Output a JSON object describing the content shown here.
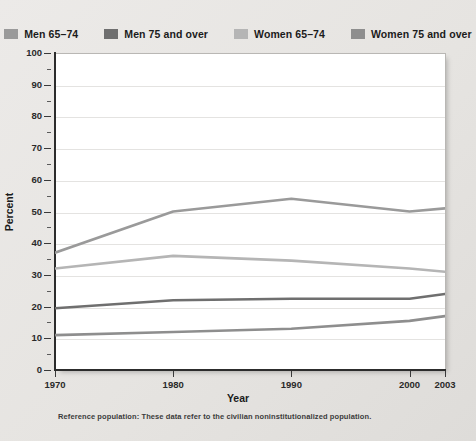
{
  "legend": {
    "items": [
      {
        "label": "Men 65–74",
        "color": "#9a9a9a",
        "key": "men_65_74"
      },
      {
        "label": "Men 75 and over",
        "color": "#6f6f6f",
        "key": "men_75_over"
      },
      {
        "label": "Women 65–74",
        "color": "#b5b5b5",
        "key": "women_65_74"
      },
      {
        "label": "Women 75 and over",
        "color": "#8e8e8e",
        "key": "women_75_over"
      }
    ]
  },
  "axes": {
    "y_title": "Percent",
    "x_title": "Year",
    "y_ticks": [
      "0",
      "10",
      "20",
      "30",
      "40",
      "50",
      "60",
      "70",
      "80",
      "90",
      "100"
    ],
    "x_ticks": [
      "1970",
      "1980",
      "1990",
      "2000",
      "2003"
    ]
  },
  "footnote": "Reference population: These data refer to the civilian noninstitutionalized population.",
  "chart_data": {
    "type": "line",
    "title": "",
    "xlabel": "Year",
    "ylabel": "Percent",
    "ylim": [
      0,
      100
    ],
    "xlim": [
      1970,
      2003
    ],
    "grid": true,
    "legend_position": "top",
    "x": [
      1970,
      1980,
      1990,
      2000,
      2003
    ],
    "series": [
      {
        "name": "Men 65–74",
        "color": "#9a9a9a",
        "values": [
          37,
          50,
          54,
          50,
          51
        ]
      },
      {
        "name": "Men 75 and over",
        "color": "#6f6f6f",
        "values": [
          19.5,
          22,
          22.5,
          22.5,
          24
        ]
      },
      {
        "name": "Women 65–74",
        "color": "#b5b5b5",
        "values": [
          32,
          36,
          34.5,
          32,
          31
        ]
      },
      {
        "name": "Women 75 and over",
        "color": "#8e8e8e",
        "values": [
          11,
          12,
          13,
          15.5,
          17
        ]
      }
    ]
  }
}
